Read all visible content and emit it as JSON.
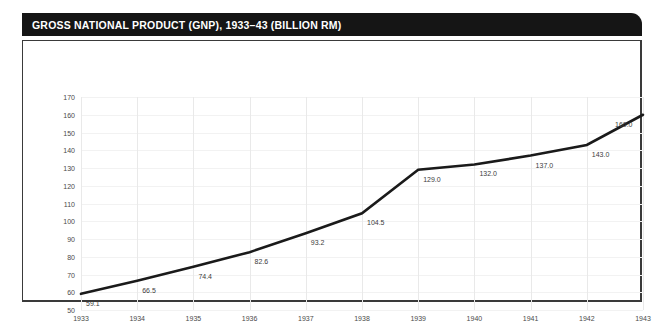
{
  "title": "GROSS NATIONAL PRODUCT (GNP), 1933–43 (BILLION RM)",
  "colors": {
    "title_bar": "#151515",
    "title_text": "#ffffff",
    "frame_border": "#3a3a3a",
    "line": "#1a1a1a",
    "gridline_vertical": "#e9e9e9",
    "gridline_horizontal": "#f2f2f2",
    "tick_text": "#4a4a4a",
    "label_text": "#3c3c3c",
    "background": "#ffffff"
  },
  "chart_data": {
    "type": "line",
    "title": "GROSS NATIONAL PRODUCT (GNP), 1933–43 (BILLION RM)",
    "xlabel": "",
    "ylabel": "",
    "categories": [
      "1933",
      "1934",
      "1935",
      "1936",
      "1937",
      "1938",
      "1939",
      "1940",
      "1941",
      "1942",
      "1943"
    ],
    "x": [
      1933,
      1934,
      1935,
      1936,
      1937,
      1938,
      1939,
      1940,
      1941,
      1942,
      1943
    ],
    "values": [
      59.1,
      66.5,
      74.4,
      82.6,
      93.2,
      104.5,
      129.0,
      132.0,
      137.0,
      143.0,
      160.0
    ],
    "point_labels": [
      "59.1",
      "66.5",
      "74.4",
      "82.6",
      "93.2",
      "104.5",
      "129.0",
      "132.0",
      "137.0",
      "143.0",
      "160.0"
    ],
    "ylim": [
      50,
      170
    ],
    "yticks": [
      50,
      60,
      70,
      80,
      90,
      100,
      110,
      120,
      130,
      140,
      150,
      160,
      170
    ],
    "ytick_labels": [
      "50",
      "60",
      "70",
      "80",
      "90",
      "100",
      "110",
      "120",
      "130",
      "140",
      "150",
      "160",
      "170"
    ],
    "xtick_labels": [
      "1933",
      "1934",
      "1935",
      "1936",
      "1937",
      "1938",
      "1939",
      "1940",
      "1941",
      "1942",
      "1943"
    ],
    "grid": true,
    "legend": false,
    "units": "billion RM"
  }
}
